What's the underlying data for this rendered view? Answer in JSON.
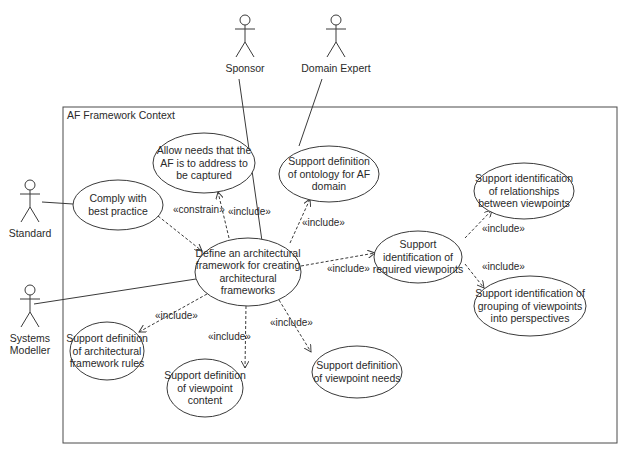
{
  "diagram": {
    "type": "UML use case diagram",
    "boundary": {
      "label": "AF Framework Context",
      "x": 63,
      "y": 107,
      "w": 554,
      "h": 336
    },
    "colors": {
      "line": "#3a3a3a",
      "text": "#2a2a2a",
      "background": "#ffffff"
    },
    "actors": [
      {
        "id": "sponsor",
        "label": "Sponsor",
        "x": 245,
        "y": 15
      },
      {
        "id": "domain-expert",
        "label": "Domain Expert",
        "x": 336,
        "y": 15
      },
      {
        "id": "standard",
        "label": "Standard",
        "x": 30,
        "y": 180
      },
      {
        "id": "systems-modeller",
        "label": "Systems Modeller",
        "label_lines": [
          "Systems",
          "Modeller"
        ],
        "x": 30,
        "y": 285
      }
    ],
    "use_cases": [
      {
        "id": "allow-needs",
        "lines": [
          "Allow needs that the",
          "AF is to address to",
          "be captured"
        ],
        "cx": 204,
        "cy": 163,
        "rx": 51,
        "ry": 30
      },
      {
        "id": "comply",
        "lines": [
          "Comply with",
          "best practice"
        ],
        "cx": 118,
        "cy": 205,
        "rx": 45,
        "ry": 25
      },
      {
        "id": "ontology",
        "lines": [
          "Support definition",
          "of ontology for AF",
          "domain"
        ],
        "cx": 329,
        "cy": 174,
        "rx": 50,
        "ry": 28
      },
      {
        "id": "define-af",
        "lines": [
          "Define an architectural",
          "framework for creating",
          "architectural",
          "frameworks"
        ],
        "cx": 248,
        "cy": 272,
        "rx": 53,
        "ry": 34
      },
      {
        "id": "relationships",
        "lines": [
          "Support identification",
          "of relationships",
          "between viewpoints"
        ],
        "cx": 524,
        "cy": 191,
        "rx": 50,
        "ry": 28
      },
      {
        "id": "required-viewpoints",
        "lines": [
          "Support",
          "identification of",
          "required viewpoints"
        ],
        "cx": 418,
        "cy": 257,
        "rx": 44,
        "ry": 26
      },
      {
        "id": "grouping",
        "lines": [
          "Support identification of",
          "grouping of viewpoints",
          "into perspectives"
        ],
        "cx": 530,
        "cy": 306,
        "rx": 56,
        "ry": 30
      },
      {
        "id": "rules",
        "lines": [
          "Support definition",
          "of architectural",
          "framework rules"
        ],
        "cx": 107,
        "cy": 351,
        "rx": 37,
        "ry": 29
      },
      {
        "id": "viewpoint-content",
        "lines": [
          "Support definition",
          "of viewpoint",
          "content"
        ],
        "cx": 205,
        "cy": 388,
        "rx": 38,
        "ry": 29
      },
      {
        "id": "viewpoint-needs",
        "lines": [
          "Support definition",
          "of viewpoint needs"
        ],
        "cx": 357,
        "cy": 372,
        "rx": 45,
        "ry": 26
      }
    ],
    "associations": [
      {
        "from": "sponsor",
        "x1": 239,
        "y1": 79,
        "x2": 262,
        "y2": 241
      },
      {
        "from": "domain-expert",
        "x1": 322,
        "y1": 79,
        "x2": 299,
        "y2": 146
      },
      {
        "from": "standard",
        "x1": 42,
        "y1": 202,
        "x2": 73,
        "y2": 204
      },
      {
        "from": "systems-modeller",
        "x1": 34,
        "y1": 304,
        "x2": 196,
        "y2": 279
      }
    ],
    "dependencies": [
      {
        "stereotype": "«constrain»",
        "x1": 158,
        "y1": 216,
        "x2": 202,
        "y2": 251,
        "lx": 173,
        "ly": 213
      },
      {
        "stereotype": "«include»",
        "x1": 229,
        "y1": 238,
        "x2": 218,
        "y2": 192,
        "lx": 228,
        "ly": 215
      },
      {
        "stereotype": "«include»",
        "x1": 290,
        "y1": 243,
        "x2": 310,
        "y2": 199,
        "lx": 302,
        "ly": 226
      },
      {
        "stereotype": "«include»",
        "x1": 301,
        "y1": 266,
        "x2": 375,
        "y2": 253,
        "lx": 327,
        "ly": 272
      },
      {
        "stereotype": "«include»",
        "x1": 465,
        "y1": 238,
        "x2": 492,
        "y2": 210,
        "lx": 482,
        "ly": 232
      },
      {
        "stereotype": "«include»",
        "x1": 465,
        "y1": 264,
        "x2": 484,
        "y2": 288,
        "lx": 482,
        "ly": 270
      },
      {
        "stereotype": "«include»",
        "x1": 207,
        "y1": 294,
        "x2": 139,
        "y2": 332,
        "lx": 155,
        "ly": 319
      },
      {
        "stereotype": "«include»",
        "x1": 246,
        "y1": 306,
        "x2": 245,
        "y2": 368,
        "lx": 208,
        "ly": 340
      },
      {
        "stereotype": "«include»",
        "x1": 279,
        "y1": 300,
        "x2": 311,
        "y2": 352,
        "lx": 270,
        "ly": 326
      }
    ]
  },
  "caption": {
    "visible": "partially clipped at bottom edge"
  }
}
